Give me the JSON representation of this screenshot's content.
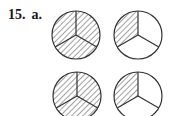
{
  "problem": {
    "number": "15.",
    "part": "a."
  },
  "figure": {
    "stroke_color": "#333333",
    "hatch_color": "#444444",
    "circles": [
      {
        "name": "circle-top-left",
        "cx": 76,
        "cy": 35,
        "r": 24,
        "parts": 3,
        "shaded": 3
      },
      {
        "name": "circle-top-right",
        "cx": 138,
        "cy": 35,
        "r": 24,
        "parts": 3,
        "shaded": 1
      },
      {
        "name": "circle-bottom-left",
        "cx": 77,
        "cy": 96,
        "r": 24,
        "parts": 3,
        "shaded": 3
      },
      {
        "name": "circle-bottom-right",
        "cx": 138,
        "cy": 96,
        "r": 24,
        "parts": 3,
        "shaded": 1
      }
    ]
  }
}
